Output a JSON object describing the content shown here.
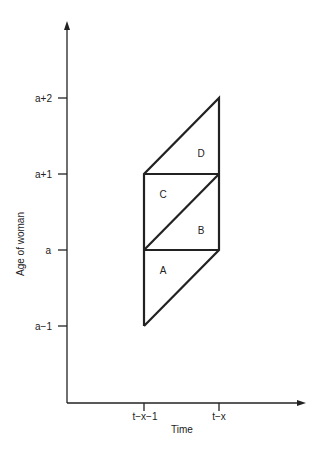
{
  "diagram": {
    "type": "lexis-diagram",
    "x_axis": {
      "label": "Time",
      "ticks": [
        {
          "label": "t−x−1",
          "x": 144
        },
        {
          "label": "t−x",
          "x": 219
        }
      ]
    },
    "y_axis": {
      "label": "Age of woman",
      "ticks": [
        {
          "label": "a+2",
          "y": 98
        },
        {
          "label": "a+1",
          "y": 174
        },
        {
          "label": "a",
          "y": 250
        },
        {
          "label": "a−1",
          "y": 326
        }
      ]
    },
    "regions": [
      {
        "label": "A"
      },
      {
        "label": "B"
      },
      {
        "label": "C"
      },
      {
        "label": "D"
      }
    ]
  }
}
